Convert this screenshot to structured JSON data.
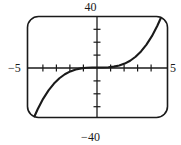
{
  "chart_data": {
    "type": "line",
    "title": "",
    "subtitle": "",
    "xlabel": "",
    "ylabel": "",
    "xlim": [
      -5,
      5
    ],
    "ylim": [
      -40,
      40
    ],
    "grid": false,
    "legend": null,
    "x_tick_labels": [
      "-5",
      "5"
    ],
    "y_tick_labels": [
      "40",
      "-40"
    ],
    "x_ticks": [
      -4,
      -3,
      -2,
      -1,
      1,
      2,
      3,
      4
    ],
    "y_ticks": [
      -30,
      -20,
      -10,
      10,
      20,
      30
    ],
    "annotations": [],
    "series": [
      {
        "name": "cubic",
        "equation": "y = 0.4 * x^3",
        "x": [
          -4.64,
          -4.4,
          -4.0,
          -3.6,
          -3.2,
          -2.8,
          -2.4,
          -2.0,
          -1.6,
          -1.2,
          -0.8,
          -0.4,
          0.0,
          0.4,
          0.8,
          1.2,
          1.6,
          2.0,
          2.4,
          2.8,
          3.2,
          3.6,
          4.0,
          4.4,
          4.64
        ],
        "values": [
          -40.0,
          -34.1,
          -25.6,
          -18.7,
          -13.1,
          -8.8,
          -5.5,
          -3.2,
          -1.6,
          -0.7,
          -0.2,
          0.0,
          0.0,
          0.0,
          0.2,
          0.7,
          1.6,
          3.2,
          5.5,
          8.8,
          13.1,
          18.7,
          25.6,
          34.1,
          40.0
        ]
      }
    ]
  },
  "labels": {
    "y_max": "40",
    "y_min": "−40",
    "x_min": "−5",
    "x_max": "5"
  },
  "colors": {
    "curve": "#1a1a1a",
    "axis": "#1a1a1a",
    "frame": "#1a1a1a",
    "background": "#ffffff"
  }
}
